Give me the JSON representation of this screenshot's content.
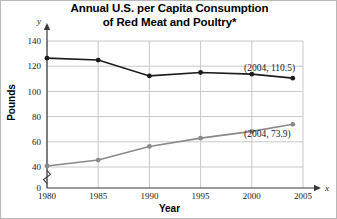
{
  "chart_data": {
    "type": "line",
    "title": "Annual U.S. per Capita Consumption of Red Meat and Poultry*",
    "title_line1": "Annual U.S. per Capita Consumption",
    "title_line2": "of Red Meat and Poultry*",
    "xlabel": "Year",
    "ylabel": "Pounds",
    "x_axis_letter": "x",
    "y_axis_letter": "y",
    "xlim": [
      1980,
      2005
    ],
    "ylim": [
      0,
      140
    ],
    "y_axis_break": true,
    "y_break_between": [
      0,
      40
    ],
    "grid": true,
    "legend": "none",
    "xticks": [
      1980,
      1985,
      1990,
      1995,
      2000,
      2005
    ],
    "xtick_labels": [
      "1980",
      "1985",
      "1990",
      "1995",
      "2000",
      "2005"
    ],
    "yticks": [
      0,
      40,
      60,
      80,
      100,
      120,
      140
    ],
    "ytick_labels": [
      "0",
      "40",
      "60",
      "80",
      "100",
      "120",
      "140"
    ],
    "x": [
      1980,
      1985,
      1990,
      1995,
      2000,
      2004
    ],
    "series": [
      {
        "name": "Red Meat",
        "color": "#1c1c1c",
        "values": [
          126.4,
          124.9,
          112.3,
          115.0,
          113.7,
          110.5
        ]
      },
      {
        "name": "Poultry",
        "color": "#8a8a8a",
        "values": [
          40.8,
          45.5,
          56.3,
          62.9,
          68.3,
          73.9
        ]
      }
    ],
    "annotations": [
      {
        "label": "(2004, 110.5)",
        "series": "Red Meat",
        "point": [
          2004,
          110.5
        ]
      },
      {
        "label": "(2004, 73.9)",
        "series": "Poultry",
        "point": [
          2004,
          73.9
        ]
      }
    ]
  }
}
